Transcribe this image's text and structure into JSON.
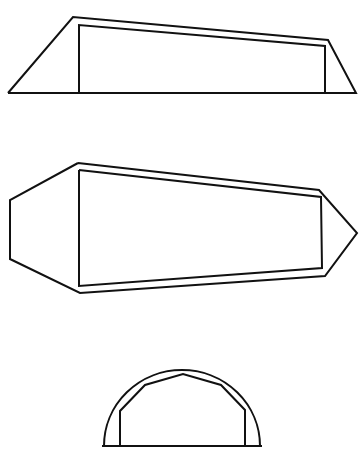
{
  "canvas": {
    "width": 359,
    "height": 453,
    "background": "#ffffff",
    "stroke_color": "#111111"
  },
  "figures": [
    {
      "name": "side-view-trapezoid",
      "outer": "8,93 73,17 328,40 356,93 8,93",
      "inner": "79,93 79,25 325,46 325,93"
    },
    {
      "name": "top-view-elongated-hexagon",
      "outer": "78,163 319,190 357,233 325,276 80,293 10,259 10,200 78,163",
      "inner": "79,170 321,197 322,268 79,286 79,170"
    },
    {
      "name": "end-view-semicircle",
      "outer_arc": "M104,446 A78,76 0 0 1 260,446",
      "baseline": "102,446 262,446",
      "inner": "120,446 120,411 145,385 183,374 221,385 245,410 245,446"
    }
  ]
}
